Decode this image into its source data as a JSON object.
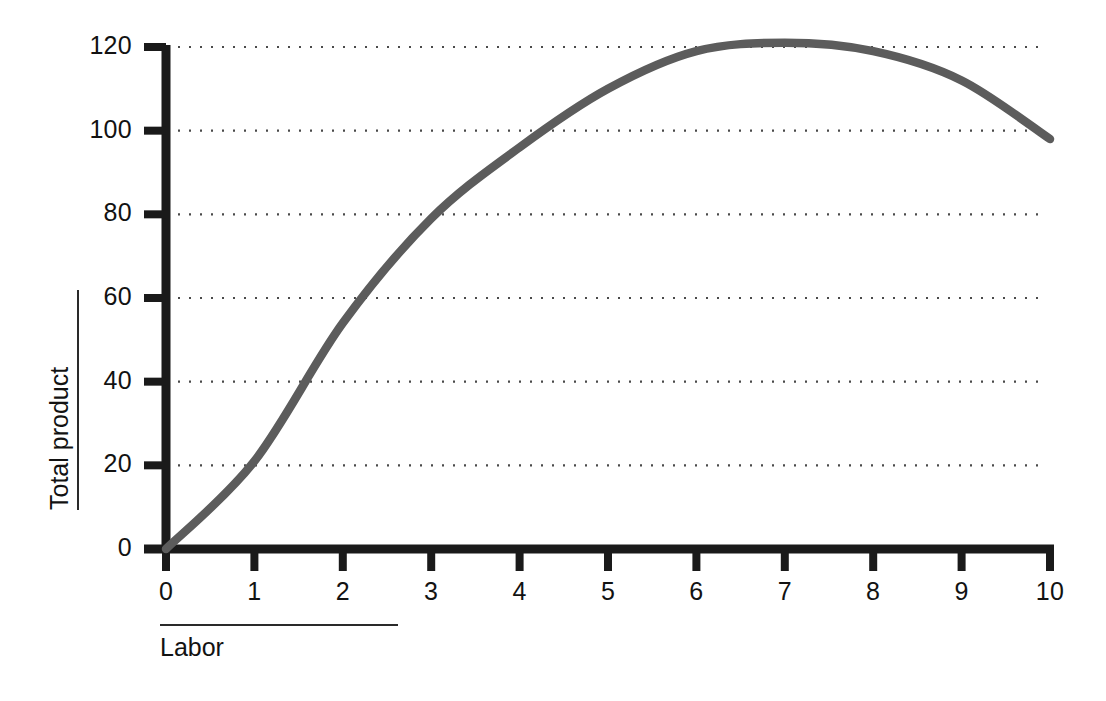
{
  "chart_data": {
    "type": "line",
    "title": "",
    "xlabel": "Labor",
    "ylabel": "Total product",
    "x": [
      0,
      1,
      2,
      3,
      4,
      5,
      6,
      7,
      8,
      9,
      10
    ],
    "values": [
      0,
      21,
      54,
      79,
      96,
      110,
      119,
      121,
      119,
      112,
      98
    ],
    "series": [
      {
        "name": "Total product",
        "values": [
          0,
          21,
          54,
          79,
          96,
          110,
          119,
          121,
          119,
          112,
          98
        ]
      }
    ],
    "xlim": [
      0,
      10
    ],
    "ylim": [
      0,
      120
    ],
    "xticks": [
      "0",
      "1",
      "2",
      "3",
      "4",
      "5",
      "6",
      "7",
      "8",
      "9",
      "10"
    ],
    "yticks": [
      "0",
      "20",
      "40",
      "60",
      "80",
      "100",
      "120"
    ],
    "ytick_values": [
      0,
      20,
      40,
      60,
      80,
      100,
      120
    ],
    "grid": "horizontal-dotted",
    "legend": "none",
    "line_color": "#5c5c5c",
    "axis_color": "#1a1a1a",
    "grid_color": "#4a4a4a",
    "background_color": "#ffffff"
  }
}
